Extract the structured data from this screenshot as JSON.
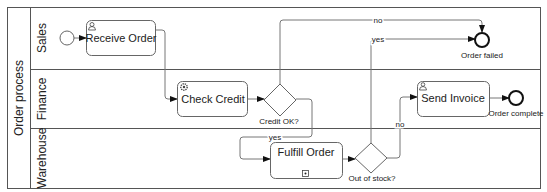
{
  "pool": {
    "label": "Order process",
    "lanes": [
      {
        "label": "Sales"
      },
      {
        "label": "Finance"
      },
      {
        "label": "Warehouse"
      }
    ]
  },
  "tasks": {
    "receive_order": {
      "label": "Receive Order",
      "type": "user-task"
    },
    "check_credit": {
      "label": "Check Credit",
      "type": "service-task"
    },
    "fulfill_order": {
      "label": "Fulfill Order",
      "type": "subprocess"
    },
    "send_invoice": {
      "label": "Send Invoice",
      "type": "user-task"
    }
  },
  "gateways": {
    "credit_ok": {
      "label": "Credit OK?"
    },
    "out_of_stock": {
      "label": "Out of stock?"
    }
  },
  "events": {
    "start": {
      "label": ""
    },
    "order_failed": {
      "label": "Order failed"
    },
    "order_complete": {
      "label": "Order complete"
    }
  },
  "flows": {
    "credit_no": "no",
    "credit_yes": "yes",
    "stock_yes": "yes",
    "stock_no": "no"
  },
  "colors": {
    "stroke": "#555555",
    "task_fill": "#ffffff",
    "line": "#777777"
  }
}
